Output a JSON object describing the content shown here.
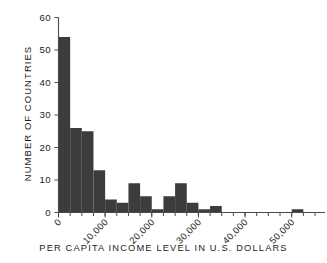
{
  "chart_data": {
    "type": "bar",
    "title": "",
    "subtitle": "",
    "xlabel": "PER CAPITA INCOME LEVEL IN U.S. DOLLARS",
    "ylabel": "NUMBER OF COUNTRIES",
    "bin_width": 2500,
    "xlim": [
      0,
      55000
    ],
    "ylim": [
      0,
      60
    ],
    "grid": false,
    "legend": null,
    "bar_color": "#3c3c3c",
    "axis_color": "#4a4a4a",
    "x_tick_values": [
      0,
      10000,
      20000,
      30000,
      40000,
      50000
    ],
    "x_tick_labels": [
      "0",
      "10,000",
      "20,000",
      "30,000",
      "40,000",
      "50,000"
    ],
    "x_minor_tick_step": 2500,
    "y_tick_values": [
      0,
      10,
      20,
      30,
      40,
      50,
      60
    ],
    "y_tick_labels": [
      "0",
      "10",
      "20",
      "30",
      "40",
      "50",
      "60"
    ],
    "bins": [
      {
        "start": 0,
        "end": 2500,
        "value": 54
      },
      {
        "start": 2500,
        "end": 5000,
        "value": 26
      },
      {
        "start": 5000,
        "end": 7500,
        "value": 25
      },
      {
        "start": 7500,
        "end": 10000,
        "value": 13
      },
      {
        "start": 10000,
        "end": 12500,
        "value": 4
      },
      {
        "start": 12500,
        "end": 15000,
        "value": 3
      },
      {
        "start": 15000,
        "end": 17500,
        "value": 9
      },
      {
        "start": 17500,
        "end": 20000,
        "value": 5
      },
      {
        "start": 20000,
        "end": 22500,
        "value": 1
      },
      {
        "start": 22500,
        "end": 25000,
        "value": 5
      },
      {
        "start": 25000,
        "end": 27500,
        "value": 9
      },
      {
        "start": 27500,
        "end": 30000,
        "value": 3
      },
      {
        "start": 30000,
        "end": 32500,
        "value": 1
      },
      {
        "start": 32500,
        "end": 35000,
        "value": 2
      },
      {
        "start": 35000,
        "end": 37500,
        "value": 0
      },
      {
        "start": 37500,
        "end": 40000,
        "value": 0
      },
      {
        "start": 40000,
        "end": 42500,
        "value": 0
      },
      {
        "start": 42500,
        "end": 45000,
        "value": 0
      },
      {
        "start": 45000,
        "end": 47500,
        "value": 0
      },
      {
        "start": 47500,
        "end": 50000,
        "value": 0
      },
      {
        "start": 50000,
        "end": 52500,
        "value": 1
      }
    ],
    "categories": [
      "0-2,500",
      "2,500-5,000",
      "5,000-7,500",
      "7,500-10,000",
      "10,000-12,500",
      "12,500-15,000",
      "15,000-17,500",
      "17,500-20,000",
      "20,000-22,500",
      "22,500-25,000",
      "25,000-27,500",
      "27,500-30,000",
      "30,000-32,500",
      "32,500-35,000",
      "35,000-37,500",
      "37,500-40,000",
      "40,000-42,500",
      "42,500-45,000",
      "45,000-47,500",
      "47,500-50,000",
      "50,000-52,500"
    ],
    "values": [
      54,
      26,
      25,
      13,
      4,
      3,
      9,
      5,
      1,
      5,
      9,
      3,
      1,
      2,
      0,
      0,
      0,
      0,
      0,
      0,
      1
    ]
  }
}
